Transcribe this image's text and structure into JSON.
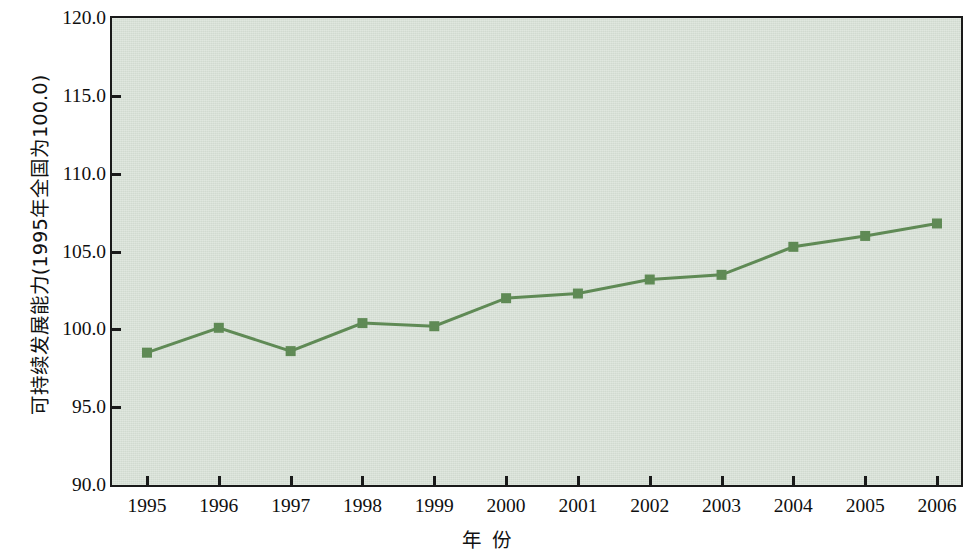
{
  "chart_data": {
    "type": "line",
    "title": "",
    "subtitle": "",
    "xlabel": "年 份",
    "ylabel": "可持续发展能力(1995年全国为100.0)",
    "categories": [
      "1995",
      "1996",
      "1997",
      "1998",
      "1999",
      "2000",
      "2001",
      "2002",
      "2003",
      "2004",
      "2005",
      "2006"
    ],
    "x": [
      1995,
      1996,
      1997,
      1998,
      1999,
      2000,
      2001,
      2002,
      2003,
      2004,
      2005,
      2006
    ],
    "values": [
      98.5,
      100.1,
      98.6,
      100.4,
      100.2,
      102.0,
      102.3,
      103.2,
      103.5,
      105.3,
      106.0,
      106.8
    ],
    "series": [
      {
        "name": "可持续发展能力",
        "values": [
          98.5,
          100.1,
          98.6,
          100.4,
          100.2,
          102.0,
          102.3,
          103.2,
          103.5,
          105.3,
          106.0,
          106.8
        ]
      }
    ],
    "ylim": [
      90.0,
      120.0
    ],
    "ytick_labels": [
      "120.0",
      "115.0",
      "110.0",
      "105.0",
      "100.0",
      "95.0",
      "90.0"
    ],
    "ytick_values": [
      120.0,
      115.0,
      110.0,
      105.0,
      100.0,
      95.0,
      90.0
    ],
    "xtick_labels": [
      "1995",
      "1996",
      "1997",
      "1998",
      "1999",
      "2000",
      "2001",
      "2002",
      "2003",
      "2004",
      "2005",
      "2006"
    ],
    "grid": false,
    "legend": "none",
    "marker": "square",
    "colors": {
      "line": "#5f8a55",
      "marker": "#5f8a55",
      "plot_background": "#d6e0d5",
      "frame": "#1a1a1a",
      "text": "#0f0f0f",
      "page_background": "#ffffff"
    }
  }
}
